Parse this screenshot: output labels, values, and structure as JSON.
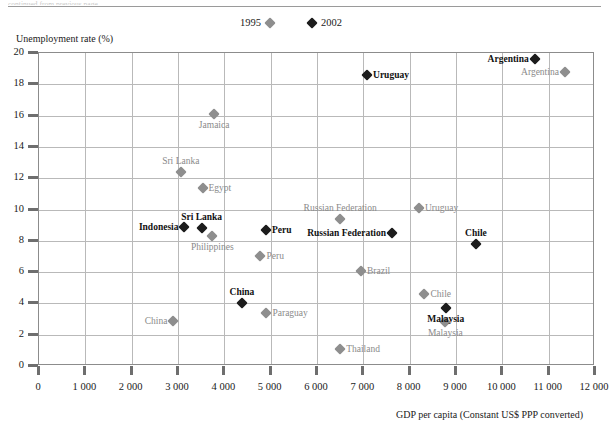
{
  "figure": {
    "top_partial_text": "continued from previous page",
    "y_axis_title": "Unemployment rate (%)",
    "x_axis_title": "GDP per capita (Constant US$ PPP converted)"
  },
  "legend": {
    "entries": [
      {
        "label": "1995",
        "marker": "gray-diamond",
        "color": "#8e8e8e",
        "marker_side": "right"
      },
      {
        "label": "2002",
        "marker": "black-diamond",
        "color": "#1c1c1c",
        "marker_side": "left"
      }
    ]
  },
  "chart_data": {
    "type": "scatter",
    "title": "",
    "xlabel": "GDP per capita (Constant US$ PPP converted)",
    "ylabel": "Unemployment rate (%)",
    "xlim": [
      0,
      12000
    ],
    "ylim": [
      0,
      20
    ],
    "xticks": [
      0,
      1000,
      2000,
      3000,
      4000,
      5000,
      6000,
      7000,
      8000,
      9000,
      10000,
      11000,
      12000
    ],
    "xtick_labels": [
      "0",
      "1 000",
      "2 000",
      "3 000",
      "4 000",
      "5 000",
      "6 000",
      "7 000",
      "8 000",
      "9 000",
      "10 000",
      "11 000",
      "12 000"
    ],
    "yticks": [
      0,
      2,
      4,
      6,
      8,
      10,
      12,
      14,
      16,
      18,
      20
    ],
    "ytick_labels": [
      "0",
      "2",
      "4",
      "6",
      "8",
      "10",
      "12",
      "14",
      "16",
      "18",
      "20"
    ],
    "grid": true,
    "legend_position": "top-center",
    "series": [
      {
        "name": "1995",
        "color": "#8e8e8e",
        "points": [
          {
            "label": "Argentina",
            "x": 11350,
            "y": 18.8,
            "label_pos": "left"
          },
          {
            "label": "Jamaica",
            "x": 3780,
            "y": 16.1,
            "label_pos": "below"
          },
          {
            "label": "Sri Lanka",
            "x": 3060,
            "y": 12.4,
            "label_pos": "above"
          },
          {
            "label": "Egypt",
            "x": 3530,
            "y": 11.4,
            "label_pos": "right"
          },
          {
            "label": "Uruguay",
            "x": 8200,
            "y": 10.1,
            "label_pos": "right"
          },
          {
            "label": "Russian Federation",
            "x": 6500,
            "y": 9.4,
            "label_pos": "above"
          },
          {
            "label": "Philippines",
            "x": 3740,
            "y": 8.3,
            "label_pos": "below"
          },
          {
            "label": "Peru",
            "x": 4780,
            "y": 7.0,
            "label_pos": "right"
          },
          {
            "label": "Brazil",
            "x": 6950,
            "y": 6.1,
            "label_pos": "right"
          },
          {
            "label": "Chile",
            "x": 8320,
            "y": 4.6,
            "label_pos": "right"
          },
          {
            "label": "Paraguay",
            "x": 4910,
            "y": 3.4,
            "label_pos": "right"
          },
          {
            "label": "China",
            "x": 2900,
            "y": 2.85,
            "label_pos": "left"
          },
          {
            "label": "Malaysia",
            "x": 8770,
            "y": 2.8,
            "label_pos": "below"
          },
          {
            "label": "Thailand",
            "x": 6500,
            "y": 1.1,
            "label_pos": "right"
          }
        ]
      },
      {
        "name": "2002",
        "color": "#1c1c1c",
        "points": [
          {
            "label": "Argentina",
            "x": 10700,
            "y": 19.6,
            "label_pos": "left"
          },
          {
            "label": "Uruguay",
            "x": 7080,
            "y": 18.6,
            "label_pos": "right"
          },
          {
            "label": "Russian Federation",
            "x": 7620,
            "y": 8.5,
            "label_pos": "left"
          },
          {
            "label": "Peru",
            "x": 4900,
            "y": 8.7,
            "label_pos": "right"
          },
          {
            "label": "Sri Lanka",
            "x": 3510,
            "y": 8.8,
            "label_pos": "above"
          },
          {
            "label": "Indonesia",
            "x": 3140,
            "y": 8.9,
            "label_pos": "left"
          },
          {
            "label": "Chile",
            "x": 9430,
            "y": 7.8,
            "label_pos": "above"
          },
          {
            "label": "China",
            "x": 4380,
            "y": 4.0,
            "label_pos": "above"
          },
          {
            "label": "Malaysia",
            "x": 8780,
            "y": 3.7,
            "label_pos": "below"
          }
        ]
      }
    ]
  }
}
